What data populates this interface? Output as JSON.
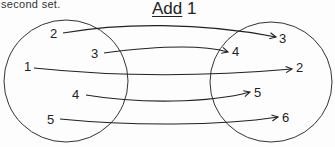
{
  "caption": "second set.",
  "title": {
    "underlined": "Add",
    "rest": " 1"
  },
  "diagram": {
    "type": "mapping",
    "rule": "Add 1",
    "domain_set": {
      "elements": [
        "2",
        "3",
        "1",
        "4",
        "5"
      ]
    },
    "codomain_set": {
      "elements": [
        "3",
        "4",
        "2",
        "5",
        "6"
      ]
    },
    "mappings": [
      {
        "from": "2",
        "to": "3"
      },
      {
        "from": "3",
        "to": "4"
      },
      {
        "from": "1",
        "to": "2"
      },
      {
        "from": "4",
        "to": "5"
      },
      {
        "from": "5",
        "to": "6"
      }
    ]
  },
  "colors": {
    "ink": "#222222",
    "background": "#fdfdfd"
  }
}
